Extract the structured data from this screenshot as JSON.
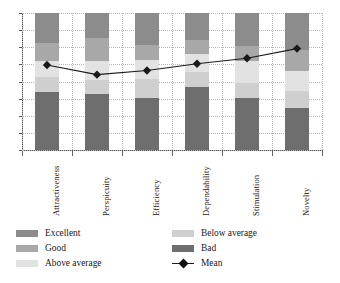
{
  "chart_data": {
    "type": "bar",
    "title": "",
    "subtitle": "",
    "xlabel": "",
    "ylabel": "",
    "stacked": true,
    "stack_mode": "percent",
    "ylim": [
      0,
      100
    ],
    "grid": true,
    "grid_style": "dotted",
    "y_tick_labels": [],
    "y_tick_count": 8,
    "legend_position": "bottom",
    "legend_columns": 2,
    "categories": [
      "Attractiveness",
      "Perspicuity",
      "Efficiency",
      "Dependability",
      "Stimulation",
      "Novelty"
    ],
    "series": [
      {
        "name": "Excellent",
        "color": "#8c8c8c",
        "values": [
          22,
          18,
          23,
          20,
          24,
          27
        ]
      },
      {
        "name": "Good",
        "color": "#a8a8a8",
        "values": [
          13,
          17,
          11,
          10,
          11,
          15
        ]
      },
      {
        "name": "Above average",
        "color": "#e2e2e2",
        "values": [
          12,
          14,
          14,
          13,
          16,
          15
        ]
      },
      {
        "name": "Below average",
        "color": "#cfcfcf",
        "values": [
          11,
          10,
          14,
          11,
          11,
          12
        ]
      },
      {
        "name": "Bad",
        "color": "#6e6e6e",
        "values": [
          42,
          41,
          38,
          46,
          38,
          31
        ]
      }
    ],
    "overlay": {
      "name": "Mean",
      "type": "line",
      "color": "#1a1a1a",
      "marker": "diamond",
      "values": [
        62,
        55,
        58,
        63,
        67,
        74
      ]
    }
  },
  "legend": {
    "left_column": [
      {
        "label": "Excellent",
        "swatch": "#8c8c8c"
      },
      {
        "label": "Good",
        "swatch": "#a8a8a8"
      },
      {
        "label": "Above average",
        "swatch": "#e2e2e2"
      }
    ],
    "right_column": [
      {
        "label": "Below average",
        "swatch": "#cfcfcf"
      },
      {
        "label": "Bad",
        "swatch": "#6e6e6e"
      },
      {
        "label": "Mean",
        "swatch": "#1a1a1a"
      }
    ]
  },
  "colors": {
    "axis": "#555555",
    "grid": "#b9b9b9",
    "background": "#ffffff",
    "text": "#1a1a1a"
  }
}
